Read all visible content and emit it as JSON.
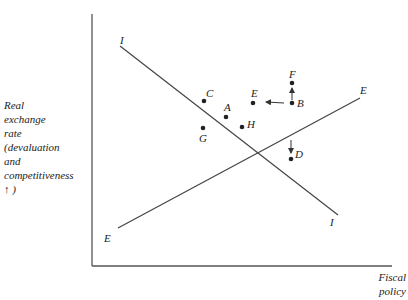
{
  "diagram": {
    "y_axis_label_lines": [
      "Real",
      "exchange",
      "rate",
      "(devaluation",
      "and",
      "competitiveness",
      "↑ )"
    ],
    "x_axis_label_lines": [
      "Fiscal",
      "policy"
    ],
    "curves": [
      {
        "name": "II",
        "start_label": "I",
        "end_label": "I"
      },
      {
        "name": "EE",
        "start_label": "E",
        "end_label": "E"
      }
    ],
    "points": {
      "A": "A",
      "B": "B",
      "C": "C",
      "D": "D",
      "E": "E",
      "F": "F",
      "G": "G",
      "H": "H"
    }
  }
}
